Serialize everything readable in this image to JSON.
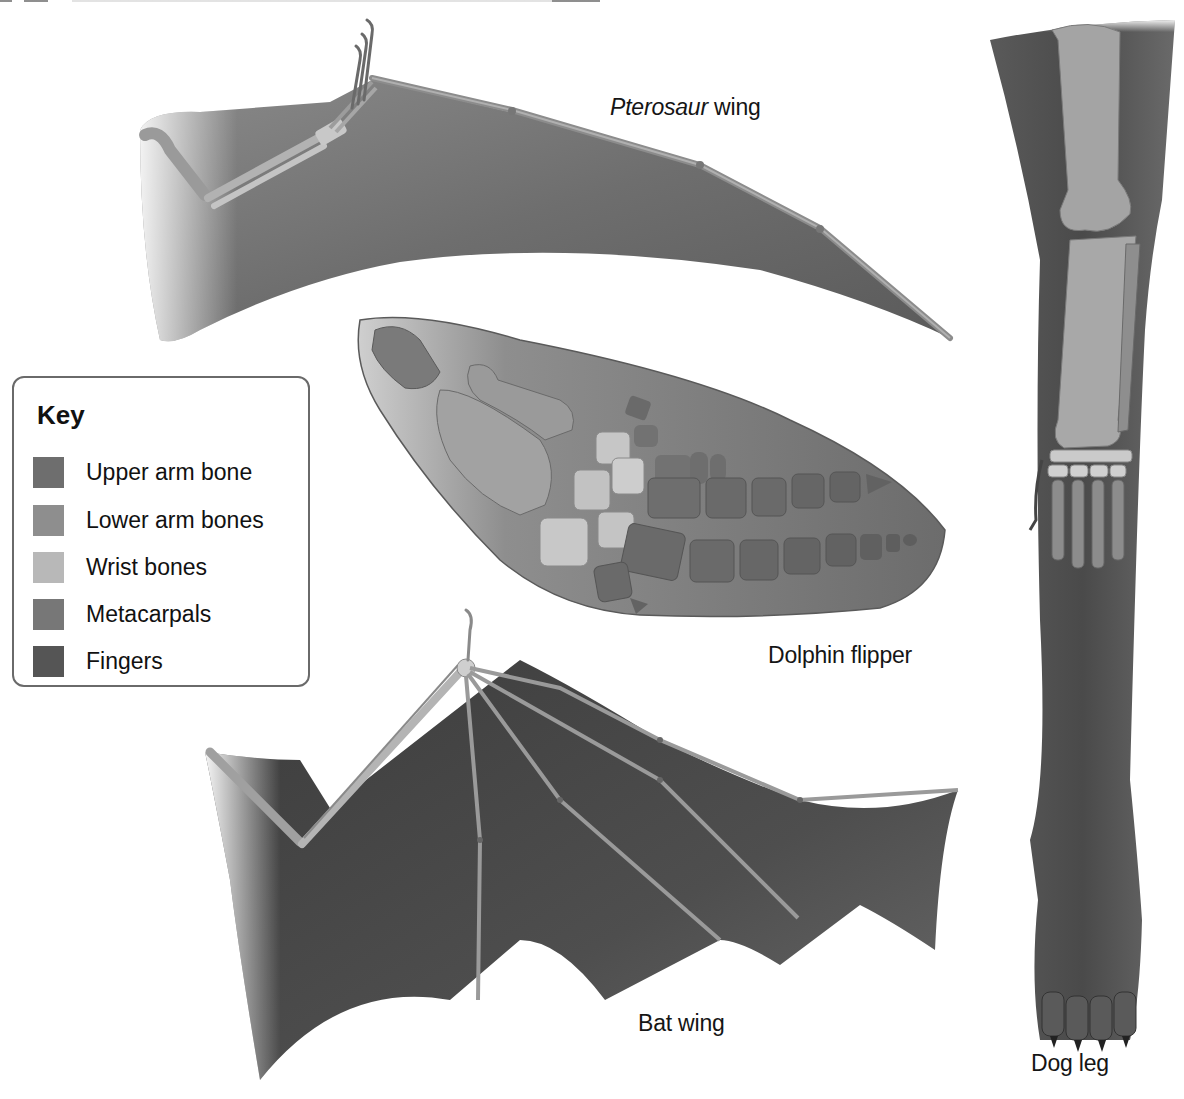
{
  "figure": {
    "note_visible": "partial text line cut off at top edge (illegible)"
  },
  "labels": {
    "pterosaur": {
      "italic": "Pterosaur",
      "rest": " wing"
    },
    "dolphin": "Dolphin flipper",
    "bat": "Bat wing",
    "dog": "Dog leg"
  },
  "key": {
    "title": "Key",
    "items": [
      {
        "label": "Upper arm bone",
        "color": "#6e6e6e"
      },
      {
        "label": "Lower arm bones",
        "color": "#8e8e8e"
      },
      {
        "label": "Wrist bones",
        "color": "#b8b8b8"
      },
      {
        "label": "Metacarpals",
        "color": "#777777"
      },
      {
        "label": "Fingers",
        "color": "#555555"
      }
    ]
  },
  "colors": {
    "membrane_pterosaur": "#6f6f6f",
    "membrane_bat": "#4a4a4a",
    "flipper_skin": "#8a8a8a",
    "leg_skin": "#5c5c5c",
    "bone_light": "#c9c9c9",
    "bone_mid": "#9a9a9a",
    "bone_dark": "#6a6a6a",
    "key_border": "#6a6a6a"
  }
}
